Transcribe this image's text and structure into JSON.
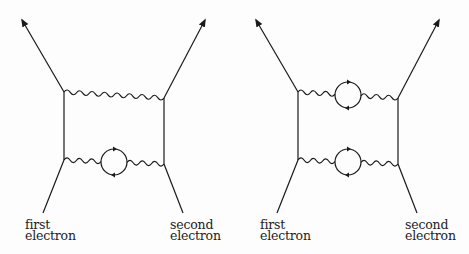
{
  "diagrams": [
    {
      "id": "left",
      "description": "Electron-electron scattering with two exchanged photons, one photon containing a vacuum-polarization loop",
      "labels": {
        "first": [
          "first",
          "electron"
        ],
        "second": [
          "second",
          "electron"
        ]
      },
      "photons": [
        {
          "loop": false
        },
        {
          "loop": true
        }
      ]
    },
    {
      "id": "right",
      "description": "Electron-electron scattering with two exchanged photons, both containing vacuum-polarization loops",
      "labels": {
        "first": [
          "first",
          "electron"
        ],
        "second": [
          "second",
          "electron"
        ]
      },
      "photons": [
        {
          "loop": true
        },
        {
          "loop": true
        }
      ]
    }
  ],
  "colors": {
    "ink": "#1a1a1a",
    "background": "#fdfdfd"
  }
}
